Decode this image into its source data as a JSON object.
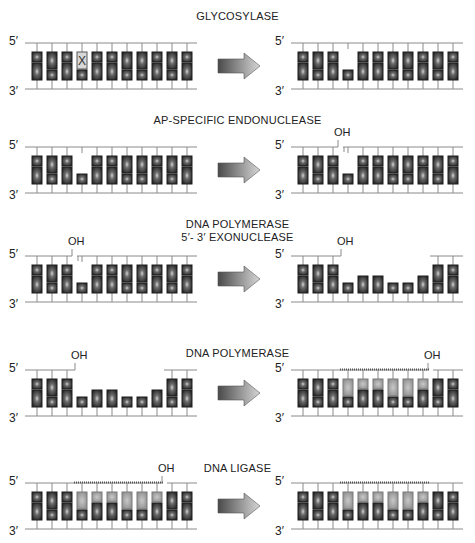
{
  "figure": {
    "steps": [
      {
        "title": "GLYCOSYLASE",
        "title_lines": [
          "GLYCOSYLASE"
        ],
        "before": {
          "top": [
            "S",
            "T",
            "S",
            "X",
            "S",
            "S",
            "T",
            "T",
            "S",
            "T",
            "S"
          ],
          "bottom": [
            "T",
            "S",
            "T",
            "S",
            "T",
            "T",
            "S",
            "S",
            "T",
            "S",
            "T"
          ],
          "nick_after": null,
          "gap": null,
          "oh_at": null,
          "new_from": null,
          "new_to": null
        },
        "after": {
          "top": [
            "S",
            "T",
            "S",
            "-",
            "S",
            "S",
            "T",
            "T",
            "S",
            "T",
            "S"
          ],
          "bottom": [
            "T",
            "S",
            "T",
            "S",
            "T",
            "T",
            "S",
            "S",
            "T",
            "S",
            "T"
          ],
          "nick_after": null,
          "gap": null,
          "oh_at": null
        }
      },
      {
        "title": "AP-SPECIFIC ENDONUCLEASE",
        "title_lines": [
          "AP-SPECIFIC ENDONUCLEASE"
        ],
        "before": {
          "top": [
            "S",
            "T",
            "S",
            "-",
            "S",
            "S",
            "T",
            "T",
            "S",
            "T",
            "S"
          ],
          "bottom": [
            "T",
            "S",
            "T",
            "S",
            "T",
            "T",
            "S",
            "S",
            "T",
            "S",
            "T"
          ]
        },
        "after": {
          "top": [
            "S",
            "T",
            "S",
            "-",
            "S",
            "S",
            "T",
            "T",
            "S",
            "T",
            "S"
          ],
          "bottom": [
            "T",
            "S",
            "T",
            "S",
            "T",
            "T",
            "S",
            "S",
            "T",
            "S",
            "T"
          ],
          "nick_after": 2,
          "oh_label": "OH"
        }
      },
      {
        "title": "DNA POLYMERASE / 5′- 3′ EXONUCLEASE",
        "title_lines": [
          "DNA POLYMERASE",
          "5′- 3′ EXONUCLEASE"
        ],
        "before": {
          "top": [
            "S",
            "T",
            "S",
            "-",
            "S",
            "S",
            "T",
            "T",
            "S",
            "T",
            "S"
          ],
          "bottom": [
            "T",
            "S",
            "T",
            "S",
            "T",
            "T",
            "S",
            "S",
            "T",
            "S",
            "T"
          ],
          "nick_after": 2,
          "oh_label": "OH"
        },
        "after": {
          "top": [
            "S",
            "T",
            "S",
            "",
            "",
            "",
            "",
            "",
            "",
            "T",
            "S"
          ],
          "bottom": [
            "T",
            "S",
            "T",
            "S",
            "T",
            "T",
            "S",
            "S",
            "T",
            "S",
            "T"
          ],
          "gap_from": 3,
          "gap_to": 8,
          "oh_label": "OH"
        }
      },
      {
        "title": "DNA POLYMERASE",
        "title_lines": [
          "DNA POLYMERASE"
        ],
        "before": {
          "top": [
            "S",
            "T",
            "S",
            "",
            "",
            "",
            "",
            "",
            "",
            "T",
            "S"
          ],
          "bottom": [
            "T",
            "S",
            "T",
            "S",
            "T",
            "T",
            "S",
            "S",
            "T",
            "S",
            "T"
          ],
          "gap_from": 3,
          "gap_to": 8,
          "oh_label": "OH"
        },
        "after": {
          "top": [
            "S",
            "T",
            "S",
            "NT",
            "NS",
            "NS",
            "NT",
            "NT",
            "NS",
            "T",
            "S"
          ],
          "bottom": [
            "T",
            "S",
            "T",
            "S",
            "T",
            "T",
            "S",
            "S",
            "T",
            "S",
            "T"
          ],
          "nick_after": 8,
          "new_from": 3,
          "new_to": 8,
          "oh_label": "OH"
        }
      },
      {
        "title": "DNA LIGASE",
        "title_lines": [
          "DNA LIGASE"
        ],
        "before": {
          "top": [
            "S",
            "T",
            "S",
            "NT",
            "NS",
            "NS",
            "NT",
            "NT",
            "NS",
            "T",
            "S"
          ],
          "bottom": [
            "T",
            "S",
            "T",
            "S",
            "T",
            "T",
            "S",
            "S",
            "T",
            "S",
            "T"
          ],
          "nick_after": 8,
          "new_from": 3,
          "new_to": 8,
          "oh_label": "OH"
        },
        "after": {
          "top": [
            "S",
            "T",
            "S",
            "NT",
            "NS",
            "NS",
            "NT",
            "NT",
            "NS",
            "T",
            "S"
          ],
          "bottom": [
            "T",
            "S",
            "T",
            "S",
            "T",
            "T",
            "S",
            "S",
            "T",
            "S",
            "T"
          ],
          "new_from": 3,
          "new_to": 8
        }
      }
    ],
    "strand_labels": {
      "five_prime": "5′",
      "three_prime": "3′"
    },
    "damaged_base_label": "X",
    "colors": {
      "backbone": "#8a8a8a",
      "base_dark": "#2e2e2e",
      "base_mid": "#6a6a6a",
      "base_new": "#a8a8a8",
      "base_new_dark": "#8c8c8c",
      "damaged_fill": "#d8d8d8",
      "arrow_dark": "#4a4a4a",
      "arrow_light": "#cfcfcf"
    }
  }
}
